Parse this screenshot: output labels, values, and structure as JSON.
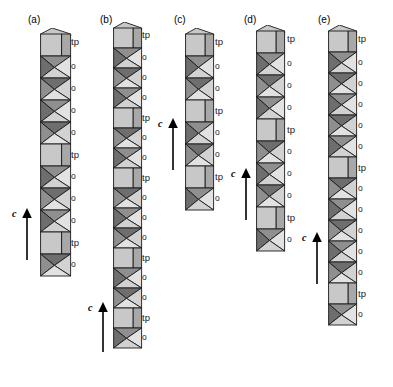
{
  "figure": {
    "axis_label": "c",
    "label_trigonal_prism": "tp",
    "label_octahedron": "o",
    "colors": {
      "prism_light": "#c8c8c8",
      "prism_shade": "#a8a8a8",
      "octa_dark": "#6e6e6e",
      "octa_mid": "#8f8f8f",
      "octa_light": "#d2d2d2",
      "octa_pale": "#e2e2e2",
      "outline": "#1a1a1a",
      "background": "#ffffff",
      "text": "#000000"
    }
  },
  "panels": [
    {
      "id": "a",
      "label": "(a)",
      "label_x": 28,
      "label_y": 14,
      "chain_x": 40,
      "chain_y": 28,
      "unit_w": 30,
      "unit_h": 22,
      "label_col_x": 71,
      "arrow": {
        "x": 12,
        "y": 208,
        "height": 52
      },
      "sequence": [
        "tp",
        "o",
        "o",
        "o",
        "o",
        "tp",
        "o",
        "o",
        "o",
        "tp",
        "o"
      ]
    },
    {
      "id": "b",
      "label": "(b)",
      "label_x": 100,
      "label_y": 14,
      "chain_x": 113,
      "chain_y": 22,
      "unit_w": 28,
      "unit_h": 20,
      "label_col_x": 142,
      "arrow": {
        "x": 88,
        "y": 302,
        "height": 50
      },
      "sequence": [
        "tp",
        "o",
        "o",
        "o",
        "tp",
        "o",
        "o",
        "tp",
        "o",
        "o",
        "o",
        "tp",
        "o",
        "o",
        "tp",
        "o"
      ]
    },
    {
      "id": "c",
      "label": "(c)",
      "label_x": 174,
      "label_y": 14,
      "chain_x": 185,
      "chain_y": 28,
      "unit_w": 28,
      "unit_h": 22,
      "label_col_x": 215,
      "arrow": {
        "x": 158,
        "y": 118,
        "height": 52
      },
      "sequence": [
        "tp",
        "o",
        "o",
        "tp",
        "o",
        "o",
        "tp",
        "o"
      ]
    },
    {
      "id": "d",
      "label": "(d)",
      "label_x": 244,
      "label_y": 14,
      "chain_x": 256,
      "chain_y": 25,
      "unit_w": 28,
      "unit_h": 22,
      "label_col_x": 287,
      "arrow": {
        "x": 231,
        "y": 168,
        "height": 52
      },
      "sequence": [
        "tp",
        "o",
        "o",
        "o",
        "tp",
        "o",
        "o",
        "o",
        "tp",
        "o"
      ]
    },
    {
      "id": "e",
      "label": "(e)",
      "label_x": 318,
      "label_y": 14,
      "chain_x": 328,
      "chain_y": 25,
      "unit_w": 28,
      "unit_h": 21,
      "label_col_x": 358,
      "arrow": {
        "x": 302,
        "y": 232,
        "height": 52
      },
      "sequence": [
        "tp",
        "o",
        "o",
        "o",
        "o",
        "o",
        "tp",
        "o",
        "o",
        "o",
        "o",
        "o",
        "tp",
        "o"
      ]
    }
  ]
}
